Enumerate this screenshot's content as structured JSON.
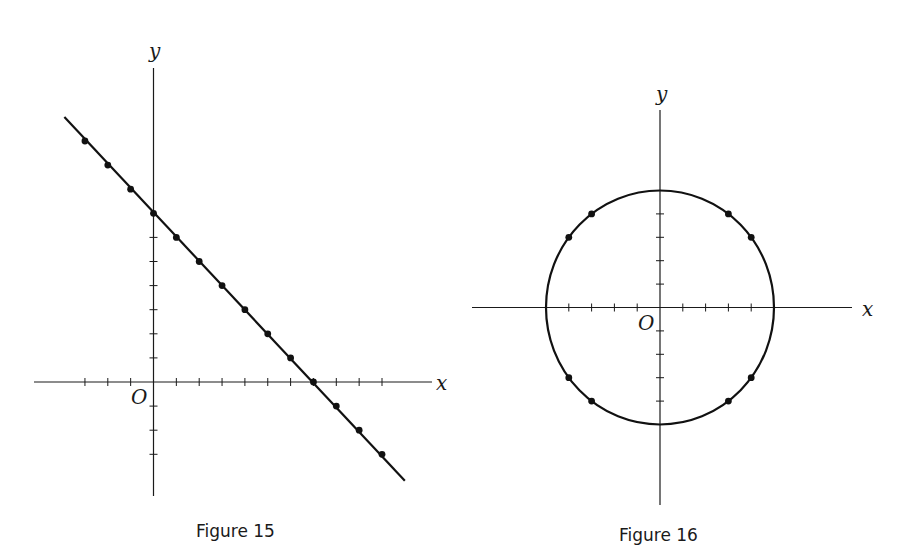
{
  "chart_data": [
    {
      "type": "line",
      "title": "Figure 15",
      "equation_depicted": "x + y = 7",
      "xlabel": "x",
      "ylabel": "y",
      "origin_label": "O",
      "grid": false,
      "legend": null,
      "x_ticks": [
        -3,
        -2,
        -1,
        1,
        2,
        3,
        4,
        5,
        6,
        7,
        8,
        9,
        10
      ],
      "y_ticks": [
        -3,
        -2,
        -1,
        1,
        2,
        3,
        4,
        5,
        6
      ],
      "xlim": [
        -5.2,
        12.5
      ],
      "ylim": [
        -4.7,
        13.2
      ],
      "line": {
        "from": [
          -3.9,
          11
        ],
        "to": [
          11,
          -4.1
        ]
      },
      "points": [
        [
          -3,
          10
        ],
        [
          -2,
          9
        ],
        [
          -1,
          8
        ],
        [
          0,
          7
        ],
        [
          1,
          6
        ],
        [
          2,
          5
        ],
        [
          3,
          4
        ],
        [
          4,
          3
        ],
        [
          5,
          2
        ],
        [
          6,
          1
        ],
        [
          7,
          0
        ],
        [
          8,
          -1
        ],
        [
          9,
          -2
        ],
        [
          10,
          -3
        ]
      ]
    },
    {
      "type": "scatter",
      "title": "Figure 16",
      "equation_depicted": "x^2 + y^2 = 25",
      "xlabel": "x",
      "ylabel": "y",
      "origin_label": "O",
      "grid": false,
      "legend": null,
      "x_ticks": [
        -4,
        -3,
        -2,
        -1,
        1,
        2,
        3,
        4
      ],
      "y_ticks": [
        -4,
        -3,
        -2,
        -1,
        1,
        2,
        3,
        4
      ],
      "xlim": [
        -8.4,
        8.5
      ],
      "ylim": [
        -8.8,
        8.7
      ],
      "circle": {
        "center": [
          0,
          0
        ],
        "radius": 5
      },
      "points": [
        [
          3,
          4
        ],
        [
          4,
          3
        ],
        [
          -3,
          4
        ],
        [
          -4,
          3
        ],
        [
          3,
          -4
        ],
        [
          4,
          -3
        ],
        [
          -3,
          -4
        ],
        [
          -4,
          -3
        ]
      ]
    }
  ],
  "captions": {
    "fig15": "Figure 15",
    "fig16": "Figure 16"
  }
}
